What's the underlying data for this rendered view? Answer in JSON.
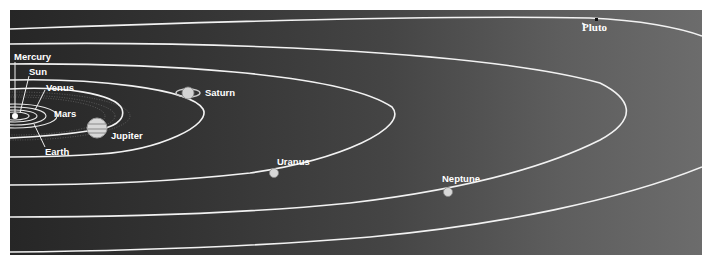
{
  "diagram": {
    "bodies": [
      {
        "id": "sun",
        "label": "Sun"
      },
      {
        "id": "mercury",
        "label": "Mercury"
      },
      {
        "id": "venus",
        "label": "Venus"
      },
      {
        "id": "earth",
        "label": "Earth"
      },
      {
        "id": "mars",
        "label": "Mars"
      },
      {
        "id": "jupiter",
        "label": "Jupiter"
      },
      {
        "id": "saturn",
        "label": "Saturn"
      },
      {
        "id": "uranus",
        "label": "Uranus"
      },
      {
        "id": "neptune",
        "label": "Neptune"
      },
      {
        "id": "pluto",
        "label": "Pluto"
      }
    ],
    "colors": {
      "background_dark": "#262626",
      "background_light": "#6c6c6c",
      "orbit_line": "#f2f2f2",
      "label_text": "#ffffff"
    }
  }
}
